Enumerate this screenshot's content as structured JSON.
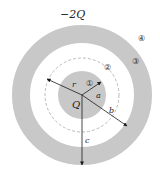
{
  "diagram": {
    "outer_shell_charge": "−2Q",
    "inner_sphere_charge": "Q",
    "radii_labels": {
      "r": "r",
      "a": "a",
      "b": "b",
      "c": "c"
    },
    "regions": [
      "①",
      "②",
      "③",
      "④"
    ],
    "colors": {
      "conductor": "#c8c8c8",
      "background": "#ffffff",
      "dashed": "#a8a8a8",
      "arrow": "#1a1a1a"
    }
  }
}
